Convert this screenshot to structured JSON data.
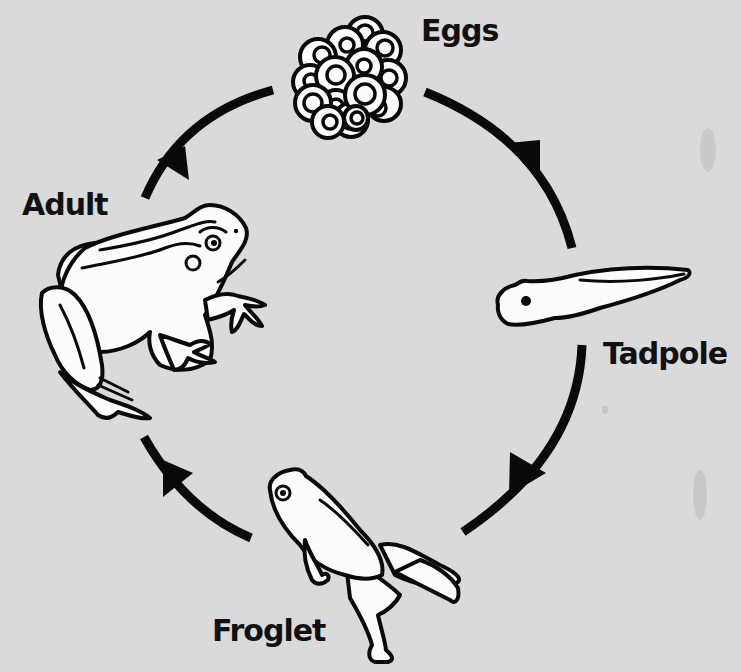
{
  "diagram": {
    "type": "life-cycle",
    "subject": "frog",
    "direction": "clockwise",
    "background_color": "#dadada",
    "line_color": "#0a0a0a",
    "stages": [
      {
        "id": "eggs",
        "label": "Eggs"
      },
      {
        "id": "tadpole",
        "label": "Tadpole"
      },
      {
        "id": "froglet",
        "label": "Froglet"
      },
      {
        "id": "adult",
        "label": "Adult"
      }
    ],
    "arrows": [
      {
        "from": "eggs",
        "to": "tadpole"
      },
      {
        "from": "tadpole",
        "to": "froglet"
      },
      {
        "from": "froglet",
        "to": "adult"
      },
      {
        "from": "adult",
        "to": "eggs"
      }
    ]
  }
}
